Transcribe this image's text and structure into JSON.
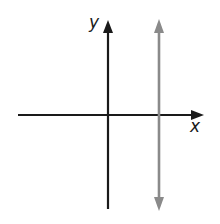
{
  "diagram": {
    "type": "coordinate-plane",
    "axes": {
      "x": {
        "label": "x",
        "color": "#1a1a1a"
      },
      "y": {
        "label": "y",
        "color": "#1a1a1a"
      }
    },
    "lines": [
      {
        "name": "vertical-line",
        "orientation": "vertical",
        "position": "positive x",
        "arrows": "both ends",
        "color": "#8a8a8a"
      }
    ]
  }
}
